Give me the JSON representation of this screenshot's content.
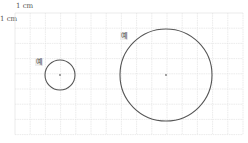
{
  "diagram": {
    "unit_label_top": "1 cm",
    "unit_label_left": "1 cm",
    "grid": {
      "x0": 15,
      "y0": 13,
      "cell": 15.2,
      "cols": 15,
      "rows": 8,
      "color": "#dddddd"
    },
    "circles": [
      {
        "name": "small-circle",
        "label": "예",
        "cx": 60,
        "cy": 75,
        "r": 15,
        "stroke": "#555555"
      },
      {
        "name": "large-circle",
        "label": "예",
        "cx": 166,
        "cy": 75,
        "r": 46,
        "stroke": "#555555"
      }
    ]
  }
}
